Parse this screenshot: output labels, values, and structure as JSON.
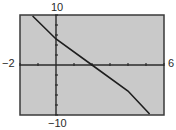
{
  "chart_data": {
    "type": "line",
    "title": "",
    "xlabel": "",
    "ylabel": "",
    "xlim": [
      -2,
      6
    ],
    "ylim": [
      -10,
      10
    ],
    "x_tick_step": 1,
    "y_tick_step": 2,
    "grid": false,
    "window_labels": {
      "xmin": "−2",
      "xmax": "6",
      "ymin": "−10",
      "ymax": "10"
    },
    "series": [
      {
        "name": "line",
        "x": [
          -1.3,
          0,
          2,
          4,
          5.2
        ],
        "y": [
          9.8,
          5.2,
          0,
          -5.2,
          -9.8
        ]
      }
    ],
    "background_color": "#c9c9c9",
    "line_color": "#1e1e1e"
  }
}
